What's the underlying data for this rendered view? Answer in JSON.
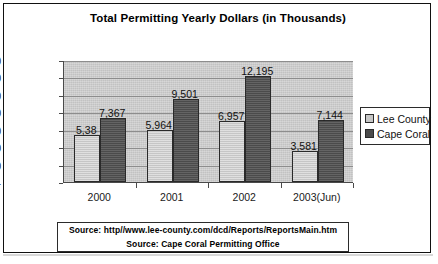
{
  "chart_data": {
    "type": "bar",
    "title": "Total Permitting Yearly Dollars (in Thousands)",
    "xlabel": "",
    "ylabel": "",
    "categories": [
      "2000",
      "2001",
      "2002",
      "2003(Jun)"
    ],
    "series": [
      {
        "name": "Lee County",
        "color": "#c6c6c6",
        "values": [
          5385,
          5964,
          6957,
          3581
        ],
        "labels": [
          "5,38",
          "5,964",
          "6,957",
          "3,581"
        ]
      },
      {
        "name": "Cape Coral",
        "color": "#4b4b4b",
        "values": [
          7367,
          9501,
          12195,
          7144
        ],
        "labels": [
          "7,367",
          "9,501",
          "12,195",
          "7,144"
        ]
      }
    ],
    "ylim": [
      0,
      14000
    ],
    "yticks": [
      "14,000",
      "12,000",
      "10,000",
      "8,000",
      "6,000",
      "4,000",
      "2,000",
      "-"
    ],
    "ytick_values": [
      14000,
      12000,
      10000,
      8000,
      6000,
      4000,
      2000,
      0
    ],
    "grid": true,
    "legend_position": "right",
    "plot_background": "#c2c2c2"
  },
  "legend": {
    "items": [
      {
        "label": "Lee County",
        "swatch": "lee"
      },
      {
        "label": "Cape Coral",
        "swatch": "cape"
      }
    ]
  },
  "source": {
    "line1": "Source: http//www.lee-county.com/dcd/Reports/ReportsMain.htm",
    "line2": "Source: Cape Coral Permitting Office"
  }
}
